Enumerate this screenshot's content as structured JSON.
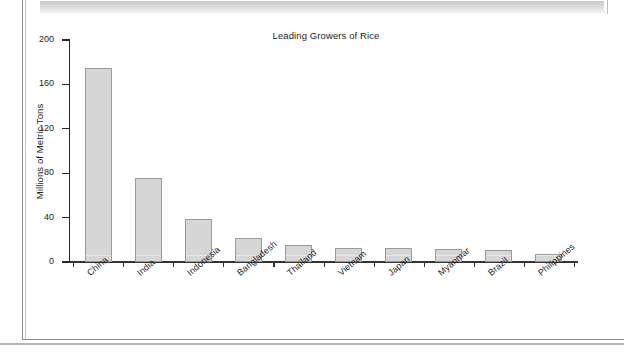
{
  "document": {
    "type": "scanned-textbook-page",
    "banner_color": "#d5d5d5",
    "frame_color": "#8a8a8a"
  },
  "chart_data": {
    "type": "bar",
    "title": "Leading Growers of Rice",
    "xlabel": "",
    "ylabel": "Millions of Metric Tons",
    "categories": [
      "China",
      "India",
      "Indonesia",
      "Bangladesh",
      "Thailand",
      "Vietnam",
      "Japan",
      "Myanmar",
      "Brazil",
      "Philippines"
    ],
    "values": [
      175,
      76,
      39,
      22,
      15,
      13,
      13,
      12,
      11,
      7
    ],
    "ylim": [
      0,
      200
    ],
    "yticks": [
      0,
      40,
      80,
      120,
      160,
      200
    ],
    "ytick_labels": [
      "0",
      "40",
      "80",
      "120",
      "160",
      "200"
    ],
    "grid": false,
    "legend": null,
    "bar_fill": "#d6d6d6",
    "bar_edge": "#9b9b9b",
    "axis_color": "#262626",
    "xlabel_rotation": -40
  }
}
